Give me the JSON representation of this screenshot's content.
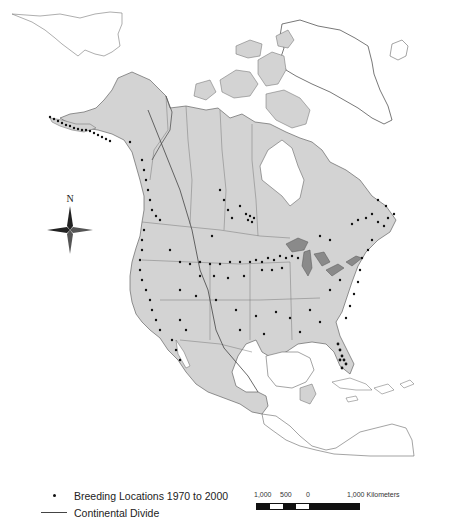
{
  "map": {
    "title": "",
    "colors": {
      "land_north_america": "#d3d3d3",
      "land_outline": "#555555",
      "other_land_fill": "#ffffff",
      "water": "#ffffff",
      "highlight_region": "#8a8a8a",
      "points": "#111111"
    },
    "north_arrow": {
      "label": "N"
    },
    "legend": {
      "items": [
        {
          "symbol": "dot",
          "label": "Breeding Locations 1970 to 2000"
        },
        {
          "symbol": "line",
          "label": "Continental Divide"
        }
      ]
    },
    "scale_bar": {
      "labels": [
        "1,000",
        "500",
        "0",
        "1,000 Kilometers"
      ],
      "units": "Kilometers"
    }
  }
}
